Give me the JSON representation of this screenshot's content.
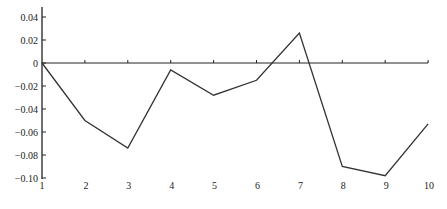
{
  "chart_data": {
    "type": "line",
    "title": "",
    "xlabel": "",
    "ylabel": "",
    "x": [
      1,
      2,
      3,
      4,
      5,
      6,
      7,
      8,
      9,
      10
    ],
    "series": [
      {
        "name": "series",
        "values": [
          0.0,
          -0.05,
          -0.074,
          -0.006,
          -0.028,
          -0.015,
          0.026,
          -0.09,
          -0.098,
          -0.053
        ],
        "color": "#333333"
      }
    ],
    "xlim": [
      1,
      10
    ],
    "ylim": [
      -0.1,
      0.045
    ],
    "x_ticks": [
      "1",
      "2",
      "3",
      "4",
      "5",
      "6",
      "7",
      "8",
      "9",
      "10"
    ],
    "y_ticks": [
      0.04,
      0.02,
      0,
      -0.02,
      -0.04,
      -0.06,
      -0.08,
      -0.1
    ],
    "y_tick_labels": [
      "0.04",
      "0.02",
      "0",
      "−0.02",
      "−0.04",
      "−0.06",
      "−0.08",
      "−0.10"
    ],
    "grid": false,
    "legend": null,
    "zero_line": true
  }
}
